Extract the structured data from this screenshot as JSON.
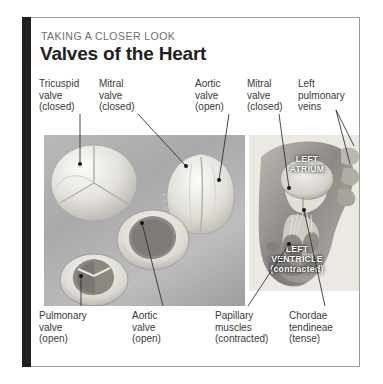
{
  "card": {
    "eyebrow": "TAKING A CLOSER LOOK",
    "title": "Valves of the Heart",
    "accent_color": "#231f20",
    "border_color": "#9a9a9a",
    "eyebrow_color": "#6e6e6e",
    "label_color": "#3a3a3a",
    "overlay_color": "#ffffff"
  },
  "labels_top": [
    {
      "line1": "Tricuspid",
      "line2": "valve",
      "line3": "(closed)"
    },
    {
      "line1": "Mitral",
      "line2": "valve",
      "line3": "(closed)"
    },
    {
      "line1": "Aortic",
      "line2": "valve",
      "line3": "(open)"
    },
    {
      "line1": "Mitral",
      "line2": "valve",
      "line3": "(closed)"
    },
    {
      "line1": "Left",
      "line2": "pulmonary",
      "line3": "veins"
    }
  ],
  "labels_bottom": [
    {
      "line1": "Pulmonary",
      "line2": "valve",
      "line3": "(open)"
    },
    {
      "line1": "Aortic",
      "line2": "valve",
      "line3": "(open)"
    },
    {
      "line1": "Papillary",
      "line2": "muscles",
      "line3": "(contracted)"
    },
    {
      "line1": "Chordae",
      "line2": "tendineae",
      "line3": "(tense)"
    }
  ],
  "overlays": [
    {
      "line1": "LEFT",
      "line2": "ATRIUM",
      "line3": ""
    },
    {
      "line1": "LEFT",
      "line2": "VENTRICLE",
      "line3": "(contracted)"
    }
  ],
  "figures": {
    "left_photo_alt": "four excised heart valve specimens on gray background",
    "right_photo_alt": "sectioned heart showing left atrium and contracted left ventricle"
  }
}
